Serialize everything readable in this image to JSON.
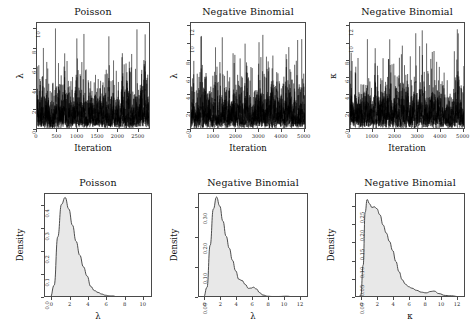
{
  "figure": {
    "width": 476,
    "height": 332,
    "background": "#ffffff",
    "layout": "2 rows x 3 columns of statistical panels",
    "trace_color": "#000000",
    "density_line_color": "#3a3a3a",
    "density_fill_color": "#e8e8e8",
    "axis_color": "#4a4a4a"
  },
  "chart_data": [
    {
      "id": "trace-poisson-lambda",
      "type": "line",
      "title": "Poisson",
      "xlabel": "Iteration",
      "ylabel": "λ",
      "xticks": [
        0,
        500,
        1000,
        1500,
        2000,
        2500
      ],
      "yticks": [
        0,
        2,
        4,
        6,
        8,
        10
      ],
      "xlim": [
        0,
        2800
      ],
      "ylim": [
        0,
        10.6
      ],
      "grid": false,
      "legend": null,
      "series": [
        {
          "name": "λ trace",
          "description": "MCMC trace of lambda, dense oscillation, mean near 2.2",
          "mean": 2.2,
          "min": 0.15,
          "max": 10.4,
          "n": 2800
        }
      ]
    },
    {
      "id": "trace-negbin-lambda",
      "type": "line",
      "title": "Negative Binomial",
      "xlabel": "Iteration",
      "ylabel": "λ",
      "xticks": [
        0,
        1000,
        2000,
        3000,
        4000,
        5000
      ],
      "yticks": [
        0,
        2,
        4,
        6,
        8,
        10,
        12
      ],
      "xlim": [
        0,
        5100
      ],
      "ylim": [
        0,
        12.4
      ],
      "grid": false,
      "legend": null,
      "series": [
        {
          "name": "λ trace",
          "description": "MCMC trace of lambda, dense oscillation, mean near 2.5",
          "mean": 2.5,
          "min": 0.2,
          "max": 12.1,
          "n": 5100
        }
      ]
    },
    {
      "id": "trace-negbin-kappa",
      "type": "line",
      "title": "Negative Binomial",
      "xlabel": "Iteration",
      "ylabel": "κ",
      "xticks": [
        0,
        1000,
        2000,
        3000,
        4000,
        5000
      ],
      "yticks": [
        0,
        2,
        4,
        6,
        8,
        10,
        12
      ],
      "xlim": [
        0,
        5100
      ],
      "ylim": [
        0,
        12.4
      ],
      "grid": false,
      "legend": null,
      "series": [
        {
          "name": "κ trace",
          "description": "MCMC trace of kappa, dense oscillation, mean near 2.6",
          "mean": 2.6,
          "min": 0.1,
          "max": 11.9,
          "n": 5100
        }
      ]
    },
    {
      "id": "density-poisson-lambda",
      "type": "area",
      "title": "Poisson",
      "xlabel": "λ",
      "ylabel": "Density",
      "xticks": [
        0,
        2,
        4,
        6,
        8,
        10
      ],
      "yticks": [
        "0.0",
        "0.1",
        "0.2",
        "0.3",
        "0.4"
      ],
      "ytick_values": [
        0.0,
        0.1,
        0.2,
        0.3,
        0.4
      ],
      "xlim": [
        -0.8,
        11.0
      ],
      "ylim": [
        0,
        0.45
      ],
      "grid": false,
      "legend": null,
      "x": [
        -0.6,
        -0.2,
        0.2,
        0.6,
        1.0,
        1.4,
        1.8,
        2.2,
        2.6,
        3.0,
        3.4,
        3.8,
        4.2,
        4.6,
        5.0,
        5.4,
        5.8,
        6.2,
        6.6,
        7.0,
        7.6,
        8.2,
        9.0,
        10.0,
        10.8
      ],
      "values": [
        0.003,
        0.005,
        0.055,
        0.265,
        0.405,
        0.435,
        0.385,
        0.315,
        0.245,
        0.185,
        0.135,
        0.095,
        0.05,
        0.032,
        0.024,
        0.017,
        0.012,
        0.009,
        0.009,
        0.006,
        0.005,
        0.004,
        0.004,
        0.004,
        0.004
      ]
    },
    {
      "id": "density-negbin-lambda",
      "type": "area",
      "title": "Negative Binomial",
      "xlabel": "λ",
      "ylabel": "Density",
      "xticks": [
        0,
        2,
        4,
        6,
        8,
        10,
        12
      ],
      "yticks": [
        "0.00",
        "0.10",
        "0.20",
        "0.30"
      ],
      "ytick_values": [
        0.0,
        0.1,
        0.2,
        0.3
      ],
      "xlim": [
        -0.8,
        13.0
      ],
      "ylim": [
        0,
        0.345
      ],
      "grid": false,
      "legend": null,
      "x": [
        -0.6,
        -0.2,
        0.2,
        0.6,
        1.0,
        1.4,
        1.8,
        2.2,
        2.6,
        3.0,
        3.4,
        3.8,
        4.2,
        4.6,
        5.0,
        5.4,
        5.8,
        6.0,
        6.4,
        6.8,
        7.2,
        7.8,
        8.4,
        9.2,
        10.2,
        11.0,
        12.0,
        12.8
      ],
      "values": [
        0.002,
        0.004,
        0.035,
        0.175,
        0.295,
        0.335,
        0.305,
        0.255,
        0.205,
        0.165,
        0.125,
        0.09,
        0.062,
        0.058,
        0.045,
        0.032,
        0.033,
        0.036,
        0.03,
        0.018,
        0.01,
        0.006,
        0.005,
        0.005,
        0.006,
        0.004,
        0.003,
        0.003
      ]
    },
    {
      "id": "density-negbin-kappa",
      "type": "area",
      "title": "Negative Binomial",
      "xlabel": "κ",
      "ylabel": "Density",
      "xticks": [
        0,
        2,
        4,
        6,
        8,
        10,
        12
      ],
      "yticks": [
        "0.00",
        "0.05",
        "0.10",
        "0.15",
        "0.20",
        "0.25"
      ],
      "ytick_values": [
        0.0,
        0.05,
        0.1,
        0.15,
        0.2,
        0.25
      ],
      "xlim": [
        -0.8,
        13.0
      ],
      "ylim": [
        0,
        0.285
      ],
      "grid": false,
      "legend": null,
      "x": [
        -0.6,
        -0.2,
        0.1,
        0.35,
        0.6,
        0.9,
        1.2,
        1.5,
        1.8,
        2.2,
        2.6,
        3.0,
        3.4,
        3.8,
        4.2,
        4.6,
        5.0,
        5.4,
        5.8,
        6.2,
        6.8,
        7.4,
        8.0,
        8.6,
        9.0,
        9.6,
        10.4,
        11.2,
        12.0,
        12.8
      ],
      "values": [
        0.003,
        0.006,
        0.09,
        0.235,
        0.27,
        0.258,
        0.248,
        0.25,
        0.245,
        0.228,
        0.2,
        0.178,
        0.155,
        0.13,
        0.1,
        0.072,
        0.05,
        0.038,
        0.031,
        0.027,
        0.021,
        0.016,
        0.014,
        0.018,
        0.019,
        0.012,
        0.007,
        0.006,
        0.004,
        0.004
      ]
    }
  ]
}
